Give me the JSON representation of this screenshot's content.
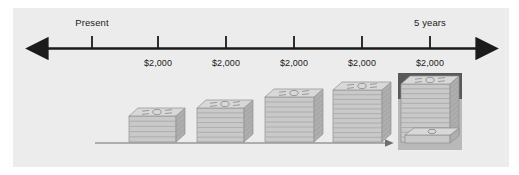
{
  "figure": {
    "background_color": "#ececec",
    "page_color": "#ffffff"
  },
  "timeline": {
    "axis_color": "#1b1b1b",
    "start_label": "Present",
    "end_label": "5 years",
    "payment_labels": [
      "$2,000",
      "$2,000",
      "$2,000",
      "$2,000",
      "$2,000"
    ],
    "tick_count": 6
  },
  "highlight": {
    "value": "$11,274",
    "header_color": "#595959",
    "panel_color": "#b9b9b9",
    "value_color": "#ffffff"
  },
  "growth_arrow": {
    "color": "#6e6e6e",
    "direction": "right"
  },
  "chart_data": {
    "type": "bar",
    "xlabel": "",
    "ylabel": "",
    "categories": [
      "Year 1",
      "Year 2",
      "Year 3",
      "Year 4",
      "Year 5"
    ],
    "tick_labels": [
      "Present",
      "$2,000",
      "$2,000",
      "$2,000",
      "$2,000",
      "$2,000"
    ],
    "values": [
      2000,
      4200,
      6620,
      9282,
      11274
    ],
    "value_labels": [
      "",
      "",
      "",
      "",
      "$11,274"
    ],
    "annotations": [
      "Present",
      "5 years",
      "$11,274"
    ],
    "legend": [],
    "grid": false
  },
  "stacks": [
    {
      "name": "stack-1",
      "left": 128,
      "width": 56,
      "height": 26,
      "layers": 5
    },
    {
      "name": "stack-2",
      "left": 196,
      "width": 56,
      "height": 34,
      "layers": 7
    },
    {
      "name": "stack-3",
      "left": 264,
      "width": 58,
      "height": 45,
      "layers": 9
    },
    {
      "name": "stack-4",
      "left": 332,
      "width": 58,
      "height": 52,
      "layers": 11
    },
    {
      "name": "stack-5",
      "left": 400,
      "width": 58,
      "height": 58,
      "layers": 12
    }
  ]
}
